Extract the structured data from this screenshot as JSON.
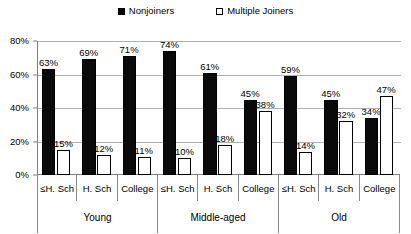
{
  "legend": {
    "entries": [
      {
        "label": "Nonjoiners",
        "style": "filled",
        "color": "#000000",
        "icon": "filled-square-icon"
      },
      {
        "label": "Multiple Joiners",
        "style": "hollow",
        "color": "#ffffff",
        "icon": "hollow-square-icon"
      }
    ]
  },
  "axis": {
    "y_ticks": [
      "0%",
      "20%",
      "40%",
      "60%",
      "80%"
    ],
    "y_tick_values": [
      0,
      20,
      40,
      60,
      80
    ]
  },
  "groups": [
    {
      "label": "Young",
      "categories": [
        {
          "label": "≤H. Sch",
          "nonjoiners": 63,
          "multiple_joiners": 15,
          "nonjoiners_label": "63%",
          "multiple_joiners_label": "15%"
        },
        {
          "label": "H. Sch",
          "nonjoiners": 69,
          "multiple_joiners": 12,
          "nonjoiners_label": "69%",
          "multiple_joiners_label": "12%"
        },
        {
          "label": "College",
          "nonjoiners": 71,
          "multiple_joiners": 11,
          "nonjoiners_label": "71%",
          "multiple_joiners_label": "11%"
        }
      ]
    },
    {
      "label": "Middle-aged",
      "categories": [
        {
          "label": "≤H. Sch",
          "nonjoiners": 74,
          "multiple_joiners": 10,
          "nonjoiners_label": "74%",
          "multiple_joiners_label": "10%"
        },
        {
          "label": "H. Sch",
          "nonjoiners": 61,
          "multiple_joiners": 18,
          "nonjoiners_label": "61%",
          "multiple_joiners_label": "18%"
        },
        {
          "label": "College",
          "nonjoiners": 45,
          "multiple_joiners": 38,
          "nonjoiners_label": "45%",
          "multiple_joiners_label": "38%"
        }
      ]
    },
    {
      "label": "Old",
      "categories": [
        {
          "label": "≤H. Sch",
          "nonjoiners": 59,
          "multiple_joiners": 14,
          "nonjoiners_label": "59%",
          "multiple_joiners_label": "14%"
        },
        {
          "label": "H. Sch",
          "nonjoiners": 45,
          "multiple_joiners": 32,
          "nonjoiners_label": "45%",
          "multiple_joiners_label": "32%"
        },
        {
          "label": "College",
          "nonjoiners": 34,
          "multiple_joiners": 47,
          "nonjoiners_label": "34%",
          "multiple_joiners_label": "47%"
        }
      ]
    }
  ],
  "chart_data": {
    "type": "bar",
    "title": "",
    "xlabel": "",
    "ylabel": "",
    "ylim": [
      0,
      80
    ],
    "grid": true,
    "legend_position": "top-center",
    "group_labels": [
      "Young",
      "Middle-aged",
      "Old"
    ],
    "categories": [
      "≤H. Sch",
      "H. Sch",
      "College",
      "≤H. Sch",
      "H. Sch",
      "College",
      "≤H. Sch",
      "H. Sch",
      "College"
    ],
    "series": [
      {
        "name": "Nonjoiners",
        "color": "#000000",
        "values": [
          63,
          69,
          71,
          74,
          61,
          45,
          59,
          45,
          34
        ],
        "labels": [
          "63%",
          "69%",
          "71%",
          "74%",
          "61%",
          "45%",
          "59%",
          "45%",
          "34%"
        ]
      },
      {
        "name": "Multiple Joiners",
        "color": "#ffffff",
        "values": [
          15,
          12,
          11,
          10,
          18,
          38,
          14,
          32,
          47
        ],
        "labels": [
          "15%",
          "12%",
          "11%",
          "10%",
          "18%",
          "38%",
          "14%",
          "32%",
          "47%"
        ]
      }
    ],
    "y_tick_labels": [
      "0%",
      "20%",
      "40%",
      "60%",
      "80%"
    ],
    "y_tick_values": [
      0,
      20,
      40,
      60,
      80
    ]
  }
}
